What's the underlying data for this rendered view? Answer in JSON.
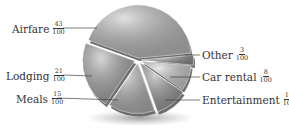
{
  "chart_data": {
    "type": "pie",
    "style": "3d-exploded",
    "title": "",
    "categories": [
      "Airfare",
      "Other",
      "Car rental",
      "Entertainment",
      "Meals",
      "Lodging"
    ],
    "values": [
      43,
      3,
      8,
      10,
      15,
      21
    ],
    "denominator": 100,
    "labels": [
      {
        "name": "Airfare",
        "num": "43",
        "den": "100"
      },
      {
        "name": "Other",
        "num": "3",
        "den": "100"
      },
      {
        "name": "Car rental",
        "num": "8",
        "den": "100"
      },
      {
        "name": "Entertainment",
        "num": "10",
        "den": "100"
      },
      {
        "name": "Meals",
        "num": "15",
        "den": "100"
      },
      {
        "name": "Lodging",
        "num": "21",
        "den": "100"
      }
    ],
    "colors": [
      "#bdbdbd",
      "#8f8f8f",
      "#cfcfcf",
      "#9a9a9a",
      "#b3b3b3",
      "#a8a8a8"
    ],
    "legend_position": "callout-labels"
  }
}
